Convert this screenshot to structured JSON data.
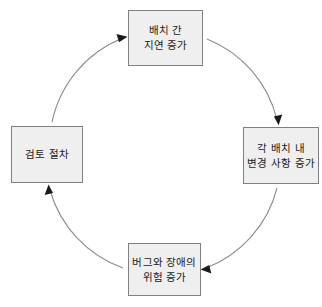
{
  "diagram": {
    "title": "",
    "type": "cycle",
    "direction": "clockwise",
    "colors": {
      "node_fill": "#efefef",
      "node_border": "#808080",
      "arc_stroke": "#888888",
      "arrow_fill": "#1a1a1a",
      "text": "#1a1a1a",
      "background": "#ffffff"
    },
    "nodes": [
      {
        "id": "node-top",
        "position": "top",
        "label": "배치 간\n지연 증가",
        "line1": "배치 간",
        "line2": "지연 증가"
      },
      {
        "id": "node-right",
        "position": "right",
        "label": "각 배치 내\n변경 사항 증가",
        "line1": "각 배치 내",
        "line2": "변경 사항 증가"
      },
      {
        "id": "node-bottom",
        "position": "bottom",
        "label": "버그와 장애의\n위험 증가",
        "line1": "버그와 장애의",
        "line2": "위험 증가"
      },
      {
        "id": "node-left",
        "position": "left",
        "label": "검토 절차",
        "line1": "검토 절차",
        "line2": ""
      }
    ],
    "arrows": [
      {
        "id": "arrow-left-to-top",
        "from": "node-left",
        "to": "node-top",
        "head": "right"
      },
      {
        "id": "arrow-top-to-right",
        "from": "node-top",
        "to": "node-right",
        "head": "down"
      },
      {
        "id": "arrow-right-to-bottom",
        "from": "node-right",
        "to": "node-bottom",
        "head": "left"
      },
      {
        "id": "arrow-bottom-to-left",
        "from": "node-bottom",
        "to": "node-left",
        "head": "up"
      }
    ]
  }
}
